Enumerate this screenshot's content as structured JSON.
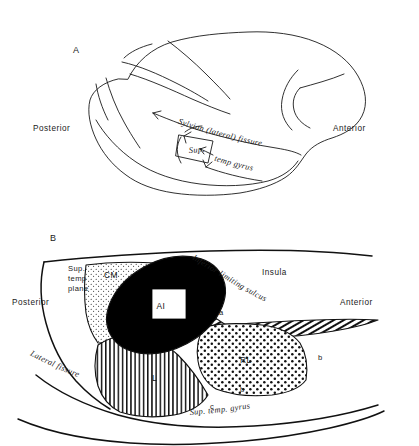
{
  "figure": {
    "panel_a": {
      "panel_label": "A",
      "orientation_left": "Posterior",
      "orientation_right": "Anterior",
      "annotations": [
        {
          "id": "sylvian",
          "text": "Sylvian  (lateral)  fissure"
        },
        {
          "id": "sup-temp-gyrus",
          "text": "Sup."
        },
        {
          "id": "sup-temp-gyrus-2",
          "text": "temp  gyrus"
        }
      ]
    },
    "panel_b": {
      "panel_label": "B",
      "orientation_left": "Posterior",
      "orientation_right": "Anterior",
      "regions": [
        {
          "id": "sup-temp-plane",
          "label_line1": "Sup.",
          "label_line2": "temp",
          "label_line3": "plane",
          "pattern": "blank"
        },
        {
          "id": "cm",
          "label": "CM",
          "pattern": "fine-stipple"
        },
        {
          "id": "ai",
          "label": "AI",
          "pattern": "solid-black"
        },
        {
          "id": "rl",
          "label": "RL",
          "pattern": "coarse-dots"
        },
        {
          "id": "l",
          "label": "L",
          "pattern": "vertical-lines"
        },
        {
          "id": "a-band",
          "label": "a",
          "pattern": "diagonal-hatch"
        },
        {
          "id": "b-region-lower",
          "label": "b",
          "pattern": "blank"
        },
        {
          "id": "b-region-right",
          "label": "b",
          "pattern": "blank"
        },
        {
          "id": "c-region",
          "label": "c",
          "pattern": "blank"
        },
        {
          "id": "insula",
          "label": "Insula",
          "pattern": "blank"
        }
      ],
      "annotations": [
        {
          "id": "inferior-limiting-sulcus",
          "text": "Inferior  limiting   sulcus"
        },
        {
          "id": "lateral-fissure",
          "text": "Lateral   fissure"
        },
        {
          "id": "sup-temp-gyrus",
          "text": "Sup. temp. gyrus"
        }
      ]
    }
  },
  "colors": {
    "ink": "#1a1a1a",
    "fill_black": "#000000",
    "background": "#ffffff"
  }
}
